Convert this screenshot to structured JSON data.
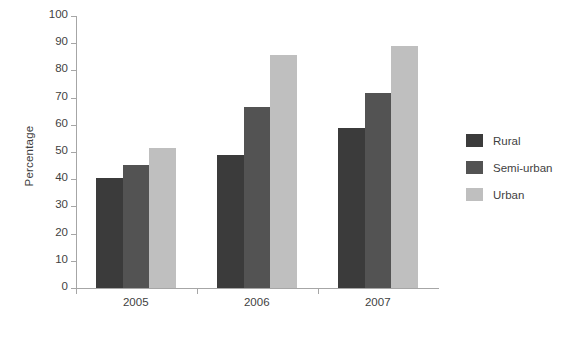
{
  "chart_data": {
    "type": "bar",
    "title": "",
    "subtitle": "",
    "xlabel": "",
    "ylabel": "Percentage",
    "categories": [
      "2005",
      "2006",
      "2007"
    ],
    "series": [
      {
        "name": "Rural",
        "color": "#3b3b3b",
        "values": [
          40.5,
          49.0,
          58.8
        ]
      },
      {
        "name": "Semi-urban",
        "color": "#535353",
        "values": [
          45.4,
          66.5,
          71.8
        ]
      },
      {
        "name": "Urban",
        "color": "#bfbfbf",
        "values": [
          51.6,
          85.5,
          88.8
        ]
      }
    ],
    "ylim": [
      0,
      100
    ],
    "y_ticks": [
      "0",
      "10",
      "20",
      "30",
      "40",
      "50",
      "60",
      "70",
      "80",
      "90",
      "100"
    ],
    "grid": false,
    "legend_position": "right",
    "axis_color": "#a6a6a6",
    "text_color": "#3f3f3f",
    "background": "#ffffff"
  },
  "legend": {
    "items": [
      {
        "label": "Rural"
      },
      {
        "label": "Semi-urban"
      },
      {
        "label": "Urban"
      }
    ]
  }
}
